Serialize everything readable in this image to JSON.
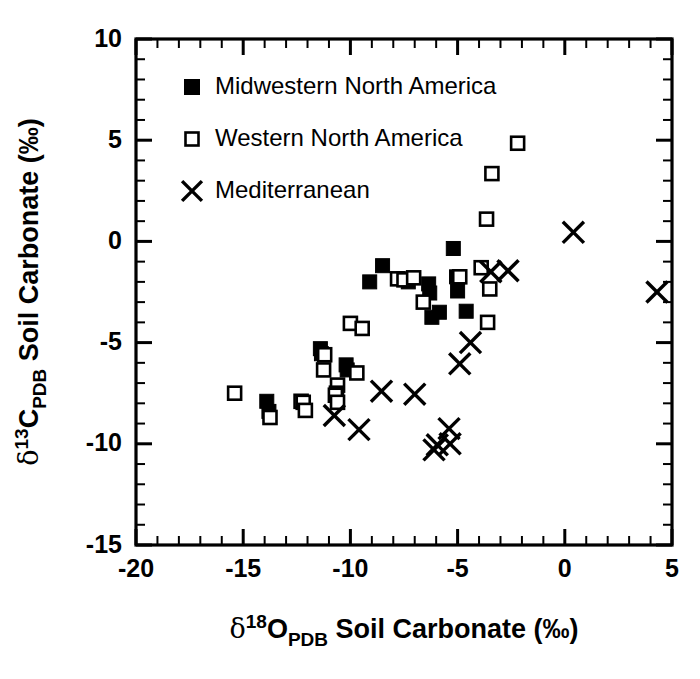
{
  "chart_data": {
    "type": "scatter",
    "title": "",
    "xlabel": "d18O_PDB Soil Carbonate (per mil)",
    "ylabel": "d13C_PDB Soil Carbonate (per mil)",
    "xlabel_parts": {
      "delta": "δ",
      "sup": "18",
      "base": "O",
      "sub": "PDB",
      "rest": " Soil Carbonate (‰)"
    },
    "ylabel_parts": {
      "delta": "δ",
      "sup": "13",
      "base": "C",
      "sub": "PDB",
      "rest": " Soil Carbonate (‰)"
    },
    "xlim": [
      -20,
      5
    ],
    "ylim": [
      -15,
      10
    ],
    "xticks": [
      -20,
      -15,
      -10,
      -5,
      0,
      5
    ],
    "yticks": [
      -15,
      -10,
      -5,
      0,
      5,
      10
    ],
    "xtick_labels": [
      "-20",
      "-15",
      "-10",
      "-5",
      "0",
      "5"
    ],
    "ytick_labels": [
      "-15",
      "-10",
      "-5",
      "0",
      "5",
      "10"
    ],
    "x_minor_step": 1,
    "y_minor_step": 1,
    "grid": false,
    "legend_position": "top-left-inside",
    "series": [
      {
        "name": "Midwestern North America",
        "marker": "filled-square",
        "color": "#000000",
        "points": [
          [
            -13.9,
            -7.9
          ],
          [
            -13.8,
            -8.4
          ],
          [
            -11.4,
            -5.3
          ],
          [
            -11.35,
            -5.55
          ],
          [
            -10.2,
            -6.1
          ],
          [
            -10.15,
            -6.35
          ],
          [
            -8.5,
            -1.2
          ],
          [
            -9.1,
            -2.0
          ],
          [
            -7.5,
            -1.85
          ],
          [
            -7.3,
            -2.0
          ],
          [
            -6.35,
            -2.1
          ],
          [
            -6.3,
            -2.55
          ],
          [
            -6.2,
            -3.75
          ],
          [
            -5.85,
            -3.5
          ],
          [
            -5.2,
            -0.35
          ],
          [
            -5.05,
            -1.75
          ],
          [
            -5.0,
            -2.45
          ],
          [
            -4.6,
            -3.45
          ]
        ]
      },
      {
        "name": "Western North America",
        "marker": "open-square",
        "color": "#000000",
        "points": [
          [
            -15.4,
            -7.5
          ],
          [
            -13.75,
            -8.7
          ],
          [
            -12.3,
            -7.9
          ],
          [
            -12.2,
            -7.95
          ],
          [
            -12.1,
            -8.35
          ],
          [
            -11.2,
            -5.6
          ],
          [
            -11.25,
            -6.35
          ],
          [
            -10.6,
            -7.1
          ],
          [
            -10.65,
            -7.5
          ],
          [
            -10.7,
            -7.6
          ],
          [
            -10.6,
            -7.95
          ],
          [
            -10.0,
            -4.05
          ],
          [
            -9.45,
            -4.3
          ],
          [
            -9.7,
            -6.5
          ],
          [
            -7.8,
            -1.85
          ],
          [
            -7.5,
            -1.9
          ],
          [
            -7.05,
            -1.8
          ],
          [
            -6.6,
            -3.0
          ],
          [
            -4.9,
            -1.75
          ],
          [
            -3.9,
            -1.3
          ],
          [
            -3.6,
            -4.0
          ],
          [
            -3.5,
            -2.35
          ],
          [
            -3.65,
            1.1
          ],
          [
            -3.4,
            3.35
          ],
          [
            -2.2,
            4.85
          ]
        ]
      },
      {
        "name": "Mediterranean",
        "marker": "cross",
        "color": "#000000",
        "points": [
          [
            -10.75,
            -8.6
          ],
          [
            -9.6,
            -9.3
          ],
          [
            -8.55,
            -7.4
          ],
          [
            -7.0,
            -7.55
          ],
          [
            -6.1,
            -10.3
          ],
          [
            -5.95,
            -10.05
          ],
          [
            -5.4,
            -9.25
          ],
          [
            -5.35,
            -10.0
          ],
          [
            -4.9,
            -6.05
          ],
          [
            -4.4,
            -5.0
          ],
          [
            -3.45,
            -1.5
          ],
          [
            -2.65,
            -1.45
          ],
          [
            0.4,
            0.45
          ],
          [
            4.3,
            -2.5
          ]
        ]
      }
    ],
    "legend": [
      {
        "label": "Midwestern North America",
        "marker": "filled-square"
      },
      {
        "label": "Western North America",
        "marker": "open-square"
      },
      {
        "label": "Mediterranean",
        "marker": "cross"
      }
    ]
  }
}
